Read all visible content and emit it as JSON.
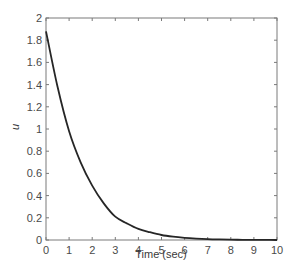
{
  "chart_data": {
    "type": "line",
    "title": "",
    "xlabel": "Time (sec)",
    "ylabel": "u",
    "xlim": [
      0,
      10
    ],
    "ylim": [
      0,
      2
    ],
    "grid": false,
    "legend": null,
    "x_ticks": [
      "0",
      "1",
      "2",
      "3",
      "4",
      "5",
      "6",
      "7",
      "8",
      "9",
      "10"
    ],
    "y_ticks": [
      "0",
      "0.2",
      "0.4",
      "0.6",
      "0.8",
      "1",
      "1.2",
      "1.4",
      "1.6",
      "1.8",
      "2"
    ],
    "series": [
      {
        "name": "u",
        "color": "#262626",
        "x": [
          0,
          0.5,
          1,
          1.5,
          2,
          2.5,
          3,
          3.5,
          4,
          4.5,
          5,
          5.5,
          6,
          6.5,
          7,
          7.5,
          8,
          8.5,
          9,
          9.5,
          10
        ],
        "values": [
          1.88,
          1.38,
          0.98,
          0.7,
          0.49,
          0.33,
          0.21,
          0.15,
          0.1,
          0.07,
          0.045,
          0.03,
          0.02,
          0.013,
          0.008,
          0.005,
          0.003,
          0.002,
          0.001,
          0.001,
          0.0
        ]
      }
    ]
  },
  "colors": {
    "axis": "#7a7a7a",
    "line": "#262626",
    "text": "#4a4a4a"
  }
}
